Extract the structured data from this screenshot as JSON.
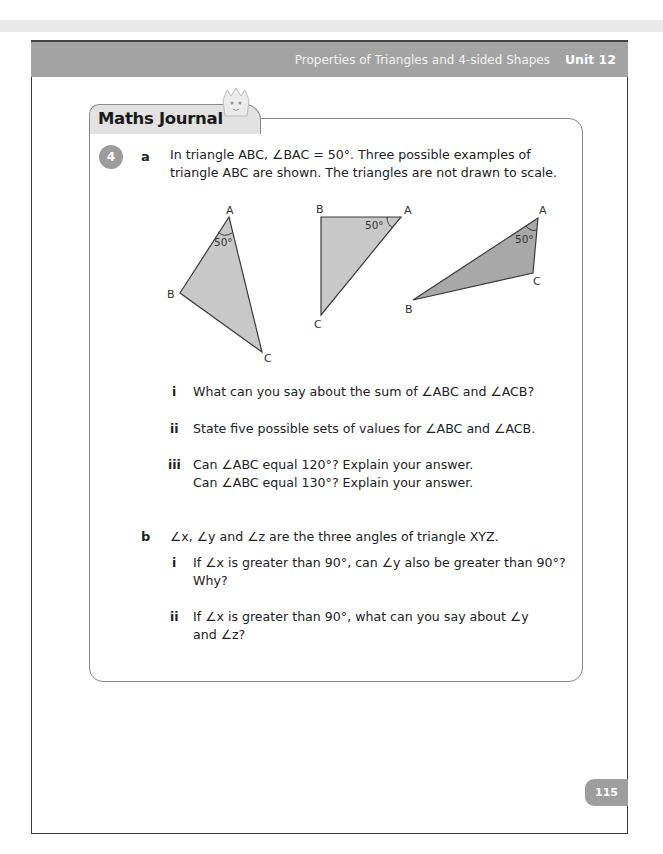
{
  "header": {
    "chapter_title": "Properties of Triangles and 4-sided Shapes",
    "unit_label": "Unit 12"
  },
  "journal": {
    "title": "Maths Journal",
    "mascot_icon": "mascot-icon"
  },
  "question": {
    "number": "4",
    "part_a": {
      "label": "a",
      "intro_line1": "In triangle ABC, ∠BAC = 50°. Three possible examples of",
      "intro_line2": "triangle ABC are shown. The triangles are not drawn to scale.",
      "figures": [
        {
          "vertices": [
            "A",
            "B",
            "C"
          ],
          "angle_label": "50°"
        },
        {
          "vertices": [
            "A",
            "B",
            "C"
          ],
          "angle_label": "50°"
        },
        {
          "vertices": [
            "A",
            "B",
            "C"
          ],
          "angle_label": "50°"
        }
      ],
      "subparts": [
        {
          "label": "i",
          "line1": "What can you say about the sum of ∠ABC and ∠ACB?"
        },
        {
          "label": "ii",
          "line1": "State five possible sets of values for ∠ABC and ∠ACB."
        },
        {
          "label": "iii",
          "line1": "Can ∠ABC equal 120°? Explain your answer.",
          "line2": "Can ∠ABC equal 130°? Explain your answer."
        }
      ]
    },
    "part_b": {
      "label": "b",
      "intro": "∠x, ∠y and ∠z are the three angles of triangle XYZ.",
      "subparts": [
        {
          "label": "i",
          "line1": "If ∠x is greater than 90°, can ∠y also be greater than 90°?",
          "line2": "Why?"
        },
        {
          "label": "ii",
          "line1": "If ∠x is greater than 90°, what can you say about ∠y",
          "line2": "and ∠z?"
        }
      ]
    }
  },
  "footer": {
    "page_number": "115"
  },
  "colors": {
    "header_bg": "#a3a3a3",
    "triangle_fill": "#c8c8c8",
    "badge_bg": "#9c9c9c"
  }
}
